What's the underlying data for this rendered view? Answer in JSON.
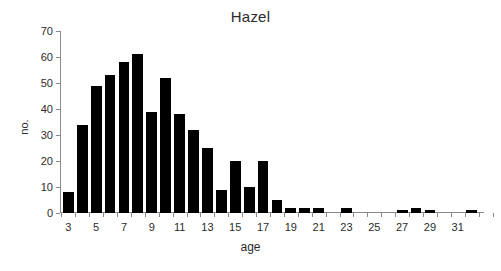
{
  "chart_data": {
    "type": "bar",
    "title": "Hazel",
    "xlabel": "age",
    "ylabel": "no.",
    "categories": [
      3,
      4,
      5,
      6,
      7,
      8,
      9,
      10,
      11,
      12,
      13,
      14,
      15,
      16,
      17,
      18,
      19,
      20,
      21,
      22,
      23,
      24,
      25,
      26,
      27,
      28,
      29,
      30,
      31,
      32
    ],
    "values": [
      8,
      34,
      49,
      53,
      58,
      61,
      39,
      52,
      38,
      32,
      25,
      9,
      20,
      10,
      20,
      5,
      2,
      2,
      2,
      0,
      2,
      0,
      0,
      0,
      1,
      2,
      1,
      0,
      0,
      1
    ],
    "ylim": [
      0,
      70
    ],
    "yticks": [
      0,
      10,
      20,
      30,
      40,
      50,
      60,
      70
    ],
    "ytick_labels": [
      "0",
      "10",
      "20",
      "30",
      "40",
      "50",
      "60",
      "70"
    ],
    "xtick_values": [
      3,
      5,
      7,
      9,
      11,
      13,
      15,
      17,
      19,
      21,
      23,
      25,
      27,
      29,
      31
    ],
    "xtick_labels": [
      "3",
      "5",
      "7",
      "9",
      "11",
      "13",
      "15",
      "17",
      "19",
      "21",
      "23",
      "25",
      "27",
      "29",
      "31"
    ],
    "xlim": [
      2.4,
      32.6
    ],
    "grid": false,
    "legend": false,
    "bar_color": "#000000",
    "axis_color": "#8a8a8a",
    "background": "#ffffff"
  }
}
